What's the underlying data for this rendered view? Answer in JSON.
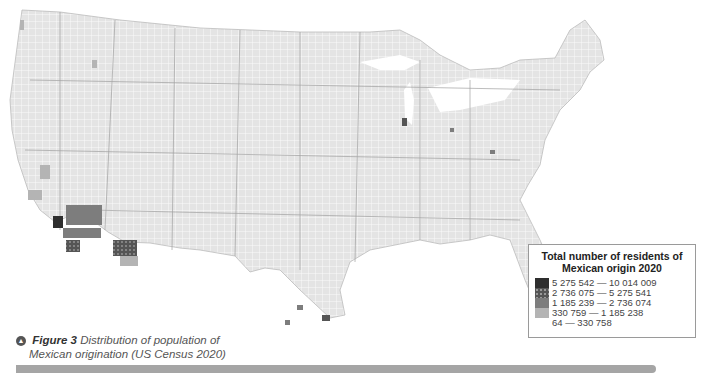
{
  "legend": {
    "title_line1": "Total number of residents of",
    "title_line2": "Mexican origin 2020",
    "items": [
      {
        "label": "5 275 542 — 10 014 009",
        "color": "#2e2e2e",
        "pattern": "solid"
      },
      {
        "label": "2 736 075 — 5 275 541",
        "color": "#555555",
        "pattern": "dotted"
      },
      {
        "label": "1 185 239 — 2 736 074",
        "color": "#7d7d7d",
        "pattern": "solid"
      },
      {
        "label": "330 759 — 1 185 238",
        "color": "#b4b4b4",
        "pattern": "solid"
      },
      {
        "label": "64 — 330 758",
        "color": "#e4e4e4",
        "pattern": "solid"
      }
    ]
  },
  "caption": {
    "figure_label": "Figure 3",
    "text_line1": "Distribution of population of",
    "text_line2": "Mexican origination (US Census 2020)"
  },
  "map": {
    "subject": "United States counties",
    "base_color": "#e4e4e4",
    "border_color": "#ffffff",
    "state_border_color": "#9a9a9a"
  }
}
